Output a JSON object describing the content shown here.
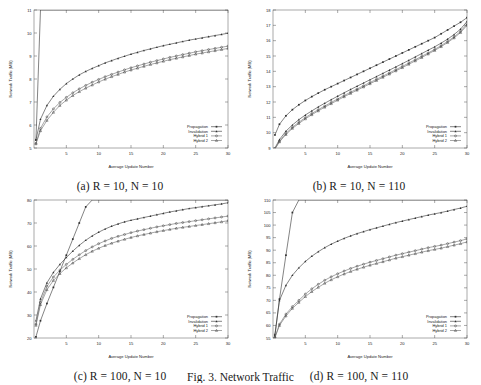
{
  "figure": {
    "caption": "Fig. 3. Network Traffic",
    "panel_captions": {
      "a": "(a)  R = 10, N = 10",
      "b": "(b)  R = 10, N = 110",
      "c": "(c)  R = 100, N = 10",
      "d": "(d)  R = 100, N = 110"
    }
  },
  "axis": {
    "xlabel": "Average Update Number",
    "ylabel": "Network Traffic (MB)"
  },
  "legend": {
    "entries": [
      "Propagation",
      "Invalidation",
      "Hybrid 1",
      "Hybrid 2"
    ]
  },
  "colors": {
    "line": "#303030",
    "line_light": "#6a6a6a",
    "axis": "#555555",
    "background": "#ffffff"
  },
  "chart_data": [
    {
      "id": "a",
      "type": "line",
      "title": "(a)  R = 10, N = 10",
      "xlabel": "Average Update Number",
      "ylabel": "Network Traffic (MB)",
      "xlim": [
        0,
        30
      ],
      "ylim": [
        5,
        11
      ],
      "xticks": [
        5,
        10,
        15,
        20,
        25,
        30
      ],
      "yticks": [
        5,
        6,
        7,
        8,
        9,
        10,
        11
      ],
      "grid": false,
      "legend_position": "lower-right",
      "x": [
        0.3,
        1,
        2,
        3,
        4,
        5,
        6,
        7,
        8,
        9,
        10,
        11,
        12,
        13,
        14,
        15,
        16,
        17,
        18,
        19,
        20,
        21,
        22,
        23,
        24,
        25,
        26,
        27,
        28,
        29,
        30
      ],
      "series": [
        {
          "name": "Propagation",
          "marker": "filled-square",
          "values": [
            5.35,
            11.0,
            11.0,
            11.0,
            11.0,
            11.0,
            11.0,
            11.0,
            11.0,
            11.0,
            11.0,
            11.0,
            11.0,
            11.0,
            11.0,
            11.0,
            11.0,
            11.0,
            11.0,
            11.0,
            11.0,
            11.0,
            11.0,
            11.0,
            11.0,
            11.0,
            11.0,
            11.0,
            11.0,
            11.0,
            11.0
          ],
          "note": "rises almost vertically off the top of the frame near x=0.6"
        },
        {
          "name": "Invalidation",
          "marker": "filled-triangle",
          "values": [
            5.35,
            6.25,
            6.85,
            7.25,
            7.55,
            7.8,
            8.0,
            8.18,
            8.33,
            8.46,
            8.58,
            8.7,
            8.8,
            8.9,
            8.99,
            9.08,
            9.16,
            9.24,
            9.31,
            9.38,
            9.45,
            9.51,
            9.57,
            9.63,
            9.69,
            9.74,
            9.79,
            9.84,
            9.89,
            9.94,
            9.99
          ]
        },
        {
          "name": "Hybrid 1",
          "marker": "open-circle",
          "values": [
            5.2,
            5.85,
            6.35,
            6.7,
            6.98,
            7.2,
            7.4,
            7.57,
            7.72,
            7.86,
            7.98,
            8.1,
            8.2,
            8.3,
            8.4,
            8.49,
            8.57,
            8.65,
            8.73,
            8.8,
            8.87,
            8.94,
            9.0,
            9.06,
            9.12,
            9.18,
            9.23,
            9.28,
            9.33,
            9.38,
            9.43
          ]
        },
        {
          "name": "Hybrid 2",
          "marker": "open-triangle",
          "values": [
            5.18,
            5.75,
            6.2,
            6.55,
            6.85,
            7.08,
            7.28,
            7.45,
            7.6,
            7.74,
            7.87,
            7.99,
            8.1,
            8.2,
            8.3,
            8.39,
            8.47,
            8.55,
            8.63,
            8.7,
            8.77,
            8.84,
            8.9,
            8.96,
            9.02,
            9.08,
            9.13,
            9.18,
            9.23,
            9.28,
            9.33
          ]
        }
      ]
    },
    {
      "id": "b",
      "type": "line",
      "title": "(b)  R = 10, N = 110",
      "xlabel": "Average Update Number",
      "ylabel": "Network Traffic (MB)",
      "xlim": [
        0,
        30
      ],
      "ylim": [
        9,
        18
      ],
      "xticks": [
        5,
        10,
        15,
        20,
        25,
        30
      ],
      "yticks": [
        9,
        10,
        11,
        12,
        13,
        14,
        15,
        16,
        17,
        18
      ],
      "grid": false,
      "legend_position": "lower-right",
      "x": [
        0.3,
        1,
        2,
        3,
        4,
        5,
        6,
        7,
        8,
        9,
        10,
        11,
        12,
        13,
        14,
        15,
        16,
        17,
        18,
        19,
        20,
        21,
        22,
        23,
        24,
        25,
        26,
        27,
        28,
        29,
        30
      ],
      "series": [
        {
          "name": "Propagation",
          "marker": "filled-square",
          "values": [
            9.85,
            10.55,
            11.1,
            11.5,
            11.82,
            12.1,
            12.35,
            12.58,
            12.8,
            13.0,
            13.2,
            13.4,
            13.6,
            13.8,
            14.0,
            14.2,
            14.4,
            14.6,
            14.8,
            15.0,
            15.2,
            15.4,
            15.6,
            15.8,
            16.0,
            16.2,
            16.45,
            16.7,
            16.95,
            17.2,
            17.5
          ]
        },
        {
          "name": "Invalidation",
          "marker": "filled-triangle",
          "values": [
            9.0,
            9.55,
            10.1,
            10.5,
            10.85,
            11.15,
            11.42,
            11.68,
            11.92,
            12.15,
            12.38,
            12.6,
            12.82,
            13.03,
            13.24,
            13.45,
            13.66,
            13.87,
            14.08,
            14.29,
            14.5,
            14.72,
            14.94,
            15.16,
            15.38,
            15.6,
            15.84,
            16.1,
            16.4,
            16.75,
            17.25
          ]
        },
        {
          "name": "Hybrid 1",
          "marker": "open-circle",
          "values": [
            8.95,
            9.45,
            9.95,
            10.35,
            10.68,
            10.98,
            11.25,
            11.5,
            11.74,
            11.97,
            12.2,
            12.42,
            12.64,
            12.85,
            13.06,
            13.27,
            13.48,
            13.69,
            13.9,
            14.11,
            14.32,
            14.54,
            14.76,
            14.98,
            15.2,
            15.43,
            15.68,
            15.95,
            16.25,
            16.6,
            17.1
          ]
        },
        {
          "name": "Hybrid 2",
          "marker": "open-triangle",
          "values": [
            8.93,
            9.4,
            9.88,
            10.28,
            10.6,
            10.9,
            11.17,
            11.42,
            11.66,
            11.89,
            12.12,
            12.34,
            12.56,
            12.77,
            12.98,
            13.19,
            13.4,
            13.61,
            13.82,
            14.03,
            14.24,
            14.46,
            14.68,
            14.9,
            15.13,
            15.36,
            15.61,
            15.88,
            16.18,
            16.53,
            17.0
          ]
        }
      ]
    },
    {
      "id": "c",
      "type": "line",
      "title": "(c)  R = 100, N = 10",
      "xlabel": "Average Update Number",
      "ylabel": "Network Traffic (MB)",
      "xlim": [
        0,
        30
      ],
      "ylim": [
        20,
        80
      ],
      "xticks": [
        5,
        10,
        15,
        20,
        25,
        30
      ],
      "yticks": [
        20,
        30,
        40,
        50,
        60,
        70,
        80
      ],
      "grid": false,
      "legend_position": "lower-right",
      "x": [
        0.3,
        1,
        2,
        3,
        4,
        5,
        6,
        7,
        8,
        9,
        10,
        11,
        12,
        13,
        14,
        15,
        16,
        17,
        18,
        19,
        20,
        21,
        22,
        23,
        24,
        25,
        26,
        27,
        28,
        29,
        30
      ],
      "series": [
        {
          "name": "Propagation",
          "marker": "filled-square",
          "values": [
            20.5,
            27.5,
            35.0,
            42.0,
            49.0,
            56.0,
            63.0,
            70.0,
            77.0,
            80.0,
            80.0,
            80.0,
            80.0,
            80.0,
            80.0,
            80.0,
            80.0,
            80.0,
            80.0,
            80.0,
            80.0,
            80.0,
            80.0,
            80.0,
            80.0,
            80.0,
            80.0,
            80.0,
            80.0,
            80.0,
            80.0
          ],
          "note": "straight rising line that exits the top of the frame near x=9"
        },
        {
          "name": "Invalidation",
          "marker": "filled-triangle",
          "values": [
            27.5,
            37.0,
            44.0,
            48.5,
            52.0,
            55.0,
            57.8,
            60.3,
            62.5,
            64.4,
            66.0,
            67.4,
            68.6,
            69.6,
            70.5,
            71.2,
            71.8,
            72.4,
            73.0,
            73.6,
            74.2,
            74.8,
            75.3,
            75.8,
            76.3,
            76.7,
            77.1,
            77.5,
            77.9,
            78.3,
            78.8
          ]
        },
        {
          "name": "Hybrid 1",
          "marker": "open-circle",
          "values": [
            26.0,
            35.5,
            42.5,
            46.5,
            49.5,
            52.0,
            54.2,
            56.2,
            58.0,
            59.6,
            61.0,
            62.2,
            63.3,
            64.2,
            65.0,
            65.8,
            66.5,
            67.1,
            67.7,
            68.3,
            68.8,
            69.3,
            69.8,
            70.2,
            70.6,
            71.0,
            71.4,
            71.8,
            72.2,
            72.6,
            73.0
          ]
        },
        {
          "name": "Hybrid 2",
          "marker": "open-triangle",
          "values": [
            25.5,
            34.5,
            41.0,
            45.0,
            48.0,
            50.5,
            52.6,
            54.5,
            56.2,
            57.7,
            59.0,
            60.2,
            61.2,
            62.1,
            62.9,
            63.7,
            64.4,
            65.0,
            65.6,
            66.2,
            66.7,
            67.2,
            67.7,
            68.1,
            68.5,
            68.9,
            69.3,
            69.7,
            70.1,
            70.5,
            71.0
          ]
        }
      ]
    },
    {
      "id": "d",
      "type": "line",
      "title": "(d)  R = 100, N = 110",
      "xlabel": "Average Update Number",
      "ylabel": "Network Traffic (MB)",
      "xlim": [
        0,
        30
      ],
      "ylim": [
        55,
        110
      ],
      "xticks": [
        5,
        10,
        15,
        20,
        25,
        30
      ],
      "yticks": [
        55,
        60,
        65,
        70,
        75,
        80,
        85,
        90,
        95,
        100,
        105,
        110
      ],
      "grid": false,
      "legend_position": "lower-right",
      "x": [
        0.3,
        1,
        2,
        3,
        4,
        5,
        6,
        7,
        8,
        9,
        10,
        11,
        12,
        13,
        14,
        15,
        16,
        17,
        18,
        19,
        20,
        21,
        22,
        23,
        24,
        25,
        26,
        27,
        28,
        29,
        30
      ],
      "series": [
        {
          "name": "Propagation",
          "marker": "filled-square",
          "values": [
            56.0,
            70.5,
            88.0,
            105.0,
            110.0,
            110.0,
            110.0,
            110.0,
            110.0,
            110.0,
            110.0,
            110.0,
            110.0,
            110.0,
            110.0,
            110.0,
            110.0,
            110.0,
            110.0,
            110.0,
            110.0,
            110.0,
            110.0,
            110.0,
            110.0,
            110.0,
            110.0,
            110.0,
            110.0,
            110.0,
            110.0
          ],
          "note": "steep straight line exiting the top of the frame near x=3.3"
        },
        {
          "name": "Invalidation",
          "marker": "filled-triangle",
          "values": [
            56.5,
            70.0,
            76.0,
            80.0,
            83.0,
            85.5,
            87.6,
            89.4,
            91.0,
            92.4,
            93.6,
            94.7,
            95.7,
            96.6,
            97.4,
            98.2,
            98.9,
            99.6,
            100.3,
            101.0,
            101.6,
            102.2,
            102.8,
            103.4,
            104.0,
            104.5,
            105.0,
            105.6,
            106.2,
            106.8,
            107.5
          ]
        },
        {
          "name": "Hybrid 1",
          "marker": "open-circle",
          "values": [
            55.3,
            60.5,
            64.5,
            67.5,
            70.0,
            72.5,
            74.6,
            76.4,
            78.0,
            79.4,
            80.6,
            81.7,
            82.7,
            83.6,
            84.4,
            85.2,
            85.9,
            86.6,
            87.3,
            88.0,
            88.6,
            89.2,
            89.8,
            90.4,
            91.0,
            91.5,
            92.0,
            92.6,
            93.2,
            93.8,
            94.5
          ]
        },
        {
          "name": "Hybrid 2",
          "marker": "open-triangle",
          "values": [
            55.2,
            60.0,
            63.8,
            66.8,
            69.2,
            71.5,
            73.5,
            75.2,
            76.8,
            78.2,
            79.4,
            80.5,
            81.5,
            82.4,
            83.2,
            84.0,
            84.7,
            85.4,
            86.1,
            86.8,
            87.4,
            88.0,
            88.6,
            89.2,
            89.8,
            90.3,
            90.8,
            91.4,
            92.0,
            92.6,
            93.3
          ]
        }
      ]
    }
  ]
}
